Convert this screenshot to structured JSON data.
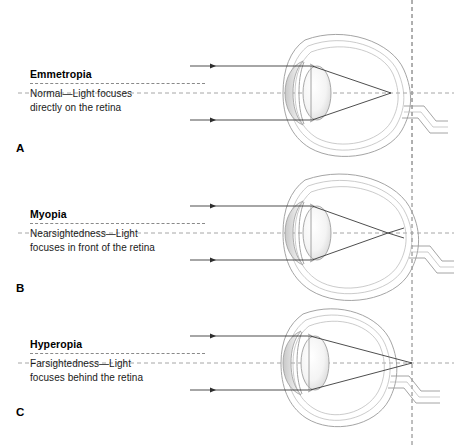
{
  "figure": {
    "background": "#ffffff",
    "ray_color": "#2e2e2e",
    "outline_color": "#9a9a9a",
    "axis_color": "#8f8f8f"
  },
  "panels": [
    {
      "letter": "A",
      "title": "Emmetropia",
      "body_line1": "Normal—Light focuses",
      "body_line2": "directly on the retina",
      "focus": "on-retina"
    },
    {
      "letter": "B",
      "title": "Myopia",
      "body_line1": "Nearsightedness—Light",
      "body_line2": "focuses in front of the retina",
      "focus": "front-of-retina"
    },
    {
      "letter": "C",
      "title": "Hyperopia",
      "body_line1": "Farsightedness—Light",
      "body_line2": "focuses behind the retina",
      "focus": "behind-retina"
    }
  ]
}
